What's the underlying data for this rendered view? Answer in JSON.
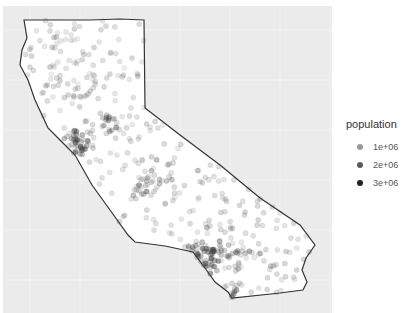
{
  "chart_data": {
    "type": "scatter",
    "title": "",
    "xlabel": "",
    "ylabel": "",
    "grid": true,
    "panel_background": "#ebebeb",
    "legend_position": "right",
    "legend": {
      "title": "population",
      "items": [
        {
          "label": "1e+06",
          "color": "#9a9a9a"
        },
        {
          "label": "2e+06",
          "color": "#5a5a5a"
        },
        {
          "label": "3e+06",
          "color": "#222222"
        }
      ]
    },
    "outline": [
      [
        24,
        20
      ],
      [
        90,
        20
      ],
      [
        120,
        19
      ],
      [
        144,
        20
      ],
      [
        145,
        108
      ],
      [
        180,
        135
      ],
      [
        220,
        165
      ],
      [
        260,
        198
      ],
      [
        300,
        225
      ],
      [
        315,
        245
      ],
      [
        306,
        258
      ],
      [
        302,
        270
      ],
      [
        307,
        282
      ],
      [
        303,
        290
      ],
      [
        280,
        293
      ],
      [
        232,
        298
      ],
      [
        228,
        292
      ],
      [
        215,
        282
      ],
      [
        205,
        268
      ],
      [
        193,
        252
      ],
      [
        165,
        246
      ],
      [
        135,
        242
      ],
      [
        128,
        235
      ],
      [
        110,
        210
      ],
      [
        92,
        185
      ],
      [
        75,
        155
      ],
      [
        60,
        140
      ],
      [
        48,
        128
      ],
      [
        42,
        115
      ],
      [
        35,
        100
      ],
      [
        28,
        80
      ],
      [
        20,
        65
      ],
      [
        22,
        50
      ],
      [
        27,
        38
      ],
      [
        24,
        20
      ]
    ],
    "clusters": [
      {
        "name": "Bay Area",
        "cx": 75,
        "cy": 145,
        "spread": 10,
        "n": 40,
        "darkness": 0.7
      },
      {
        "name": "Los Angeles",
        "cx": 205,
        "cy": 258,
        "spread": 12,
        "n": 50,
        "darkness": 0.75
      },
      {
        "name": "San Diego",
        "cx": 235,
        "cy": 290,
        "spread": 5,
        "n": 10,
        "darkness": 0.6
      },
      {
        "name": "Sacramento",
        "cx": 108,
        "cy": 120,
        "spread": 8,
        "n": 18,
        "darkness": 0.5
      },
      {
        "name": "Central Valley",
        "cx": 150,
        "cy": 180,
        "spread": 18,
        "n": 40,
        "darkness": 0.35
      },
      {
        "name": "Inland Empire",
        "cx": 240,
        "cy": 255,
        "spread": 14,
        "n": 25,
        "darkness": 0.4
      },
      {
        "name": "North",
        "cx": 80,
        "cy": 70,
        "spread": 30,
        "n": 50,
        "darkness": 0.25
      }
    ]
  }
}
